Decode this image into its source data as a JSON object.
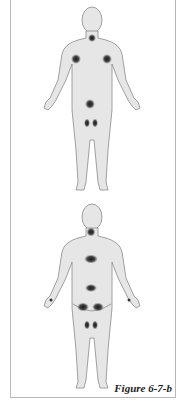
{
  "figure": {
    "caption": "Figure 6-7-b",
    "body_fill": "#e6e6e6",
    "body_stroke": "#8a8a8a",
    "spot_color": "#222222",
    "views": [
      {
        "name": "front",
        "spots": [
          "neck",
          "left-shoulder",
          "right-shoulder",
          "pubic",
          "left-knee",
          "right-knee"
        ]
      },
      {
        "name": "back",
        "spots": [
          "neck",
          "mid-back",
          "lower-back",
          "left-buttock",
          "right-buttock",
          "left-knee",
          "right-knee",
          "left-palm",
          "right-palm"
        ]
      }
    ]
  }
}
